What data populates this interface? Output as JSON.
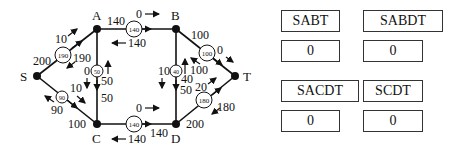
{
  "graph": {
    "nodes": {
      "S": {
        "label": "S",
        "x": 37,
        "y": 76
      },
      "A": {
        "label": "A",
        "x": 97,
        "y": 29
      },
      "B": {
        "label": "B",
        "x": 176,
        "y": 29
      },
      "C": {
        "label": "C",
        "x": 97,
        "y": 124
      },
      "D": {
        "label": "D",
        "x": 176,
        "y": 124
      },
      "T": {
        "label": "T",
        "x": 235,
        "y": 76
      }
    },
    "edges": {
      "SA": {
        "capacity": "200",
        "flow": "190",
        "forward": "10",
        "backward": "190"
      },
      "SC": {
        "capacity": "100",
        "flow": "90",
        "forward": "10",
        "backward": "90"
      },
      "AB": {
        "capacity": "140",
        "flow": "140",
        "forward": "0",
        "backward": "140"
      },
      "AC": {
        "capacity": "50",
        "flow": "50",
        "forward": "0",
        "backward": "50"
      },
      "BD": {
        "capacity": "50",
        "flow": "40",
        "forward": "10",
        "backward": "40"
      },
      "BT": {
        "capacity": "100",
        "flow": "100",
        "forward": "0",
        "backward": "100"
      },
      "CD": {
        "capacity": "140",
        "flow": "140",
        "forward": "0",
        "backward": "140"
      },
      "DT": {
        "capacity": "200",
        "flow": "180",
        "forward": "20",
        "backward": "180"
      }
    }
  },
  "paths": [
    {
      "name": "SABT",
      "value": "0"
    },
    {
      "name": "SABDT",
      "value": "0"
    },
    {
      "name": "SACDT",
      "value": "0"
    },
    {
      "name": "SCDT",
      "value": "0"
    }
  ]
}
